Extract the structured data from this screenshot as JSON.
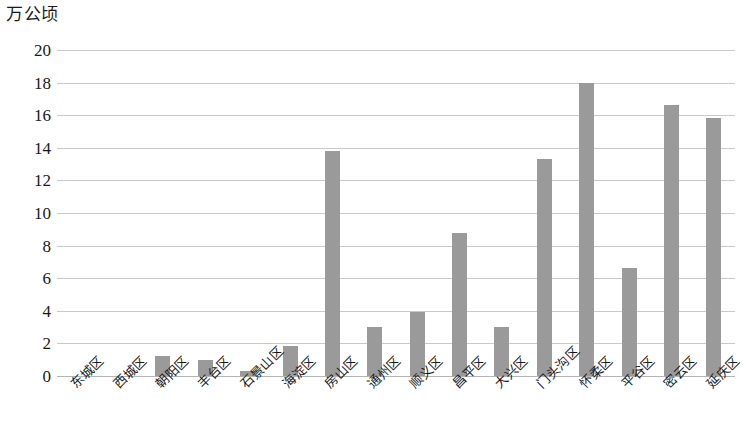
{
  "chart_data": {
    "type": "bar",
    "title": "",
    "subtitle": "",
    "unit_label": "万公顷",
    "xlabel": "",
    "ylabel": "万公顷",
    "ylim": [
      0,
      20
    ],
    "ytick_step": 2,
    "yticks": [
      "20",
      "18",
      "16",
      "14",
      "12",
      "10",
      "8",
      "6",
      "4",
      "2",
      "0"
    ],
    "ytick_values": [
      20,
      18,
      16,
      14,
      12,
      10,
      8,
      6,
      4,
      2,
      0
    ],
    "grid": true,
    "grid_axis": "y",
    "legend": false,
    "legend_position": "none",
    "bar_color": "#9a9a9a",
    "grid_color": "#c9c9c9",
    "axis_color": "#b4b4b4",
    "text_color": "#1a1a1a",
    "categories": [
      "东城区",
      "西城区",
      "朝阳区",
      "丰台区",
      "石景山区",
      "海淀区",
      "房山区",
      "通州区",
      "顺义区",
      "昌平区",
      "大兴区",
      "门头沟区",
      "怀柔区",
      "平谷区",
      "密云区",
      "延庆区"
    ],
    "values": [
      0,
      0,
      1.2,
      1.0,
      0.3,
      1.85,
      13.8,
      3.0,
      3.9,
      8.8,
      3.0,
      13.3,
      18.0,
      6.6,
      16.6,
      15.8
    ]
  }
}
